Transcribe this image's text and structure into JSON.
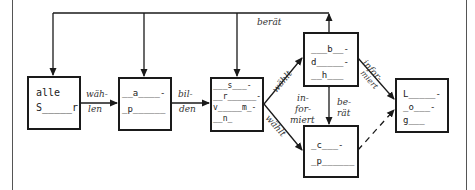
{
  "diagram": {
    "boxes": [
      {
        "id": "box-alle-schueler",
        "lines": [
          "alle",
          "S_____r"
        ]
      },
      {
        "id": "box-klassensprecher",
        "lines": [
          "__a____-",
          "_p______"
        ]
      },
      {
        "id": "box-schuelervertretung",
        "lines": [
          "___s___-",
          "__r______-",
          "v_____m_-",
          "__n_"
        ]
      },
      {
        "id": "box-beratungslehrer",
        "lines": [
          "___b__-",
          "d_____-",
          "__h___"
        ]
      },
      {
        "id": "box-schulkonferenz",
        "lines": [
          "_c___-",
          "_p______"
        ]
      },
      {
        "id": "box-schulleitung",
        "lines": [
          "L_____-",
          "_o___-",
          "g___"
        ]
      }
    ],
    "edge_labels": {
      "waehlen_1": "wäh-",
      "waehlen_2": "len",
      "bilden_1": "bil-",
      "bilden_2": "den",
      "beraet_top": "berät",
      "waehlt_up": "wählt",
      "waehlt_down": "wählt",
      "informiert_left_1": "in-",
      "informiert_left_2": "for-",
      "informiert_left_3": "miert",
      "beraet_mid_1": "be-",
      "beraet_mid_2": "rät",
      "informiert_right_1": "infor-",
      "informiert_right_2": "miert"
    }
  }
}
